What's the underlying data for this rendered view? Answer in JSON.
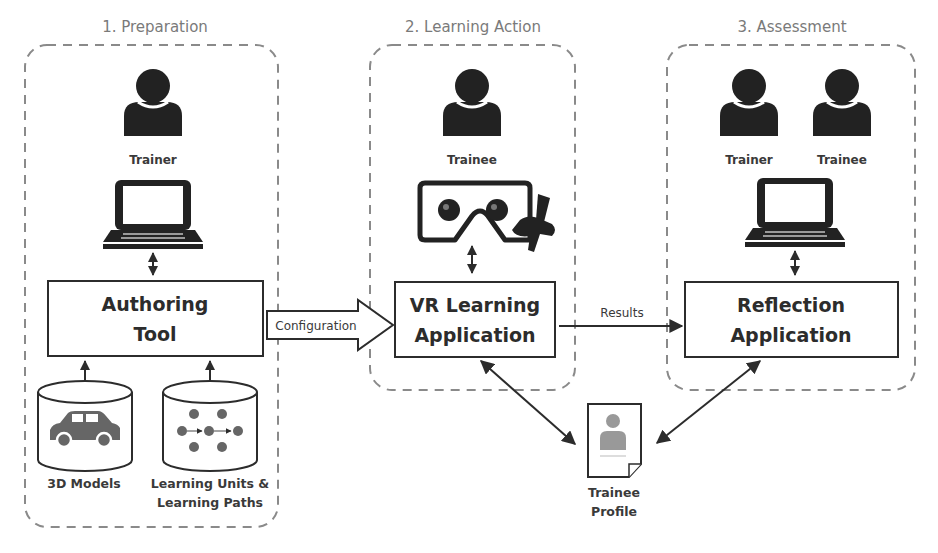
{
  "phases": [
    {
      "title": "1. Preparation",
      "roles": [
        "Trainer"
      ],
      "device": "laptop-icon",
      "box": [
        "Authoring",
        "Tool"
      ],
      "resources": [
        {
          "label": [
            "3D Models"
          ],
          "icon": "car-icon"
        },
        {
          "label": [
            "Learning Units &",
            "Learning Paths"
          ],
          "icon": "network-graph-icon"
        }
      ]
    },
    {
      "title": "2. Learning Action",
      "roles": [
        "Trainee"
      ],
      "device": "vr-headset-spray-gun-icon",
      "box": [
        "VR Learning",
        "Application"
      ]
    },
    {
      "title": "3. Assessment",
      "roles": [
        "Trainer",
        "Trainee"
      ],
      "device": "laptop-icon",
      "box": [
        "Reflection",
        "Application"
      ]
    }
  ],
  "connectors": {
    "configuration": "Configuration",
    "results": "Results"
  },
  "profile": {
    "label": [
      "Trainee",
      "Profile"
    ],
    "icon": "document-profile-icon"
  },
  "colors": {
    "dash": "#8a8a8a",
    "ink": "#2c2c2c",
    "muted": "#7a7a7a",
    "icon_gray": "#666666"
  }
}
